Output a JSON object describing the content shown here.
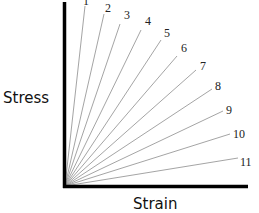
{
  "diagram": {
    "y_label": "Stress",
    "x_label": "Strain",
    "origin": [
      65,
      186
    ],
    "lines": [
      {
        "label": "1",
        "end": [
          85,
          6
        ],
        "label_pos": [
          83,
          5
        ]
      },
      {
        "label": "2",
        "end": [
          104,
          14
        ],
        "label_pos": [
          105,
          12
        ]
      },
      {
        "label": "3",
        "end": [
          120,
          24
        ],
        "label_pos": [
          124,
          19
        ]
      },
      {
        "label": "4",
        "end": [
          141,
          30
        ],
        "label_pos": [
          145,
          25
        ]
      },
      {
        "label": "5",
        "end": [
          161,
          40
        ],
        "label_pos": [
          164,
          37
        ]
      },
      {
        "label": "6",
        "end": [
          177,
          56
        ],
        "label_pos": [
          181,
          52
        ]
      },
      {
        "label": "7",
        "end": [
          196,
          70
        ],
        "label_pos": [
          200,
          70
        ]
      },
      {
        "label": "8",
        "end": [
          212,
          89
        ],
        "label_pos": [
          215,
          90
        ]
      },
      {
        "label": "9",
        "end": [
          223,
          111
        ],
        "label_pos": [
          226,
          114
        ]
      },
      {
        "label": "10",
        "end": [
          230,
          134
        ],
        "label_pos": [
          233,
          138
        ]
      },
      {
        "label": "11",
        "end": [
          238,
          158
        ],
        "label_pos": [
          240,
          166
        ]
      }
    ],
    "colors": {
      "axis": "#000000",
      "line": "#9a9a9a",
      "text": "#222222"
    }
  }
}
